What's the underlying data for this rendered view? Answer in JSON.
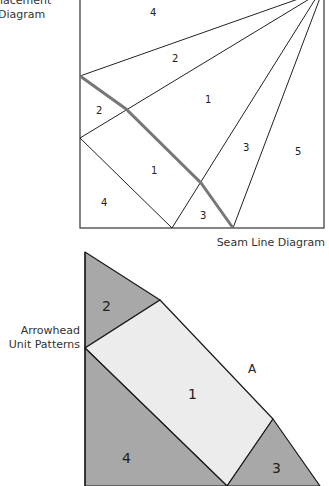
{
  "captions": {
    "placement": "Placement\nDiagram",
    "placement_line1": "lacement",
    "placement_line2": "Diagram",
    "seam": "Seam Line Diagram",
    "arrowhead_line1": "Arrowhead",
    "arrowhead_line2": "Unit Patterns"
  },
  "seam_diagram": {
    "labels": [
      {
        "text": "4",
        "x": 150,
        "y": 16
      },
      {
        "text": "2",
        "x": 172,
        "y": 62
      },
      {
        "text": "2",
        "x": 96,
        "y": 114
      },
      {
        "text": "1",
        "x": 205,
        "y": 103
      },
      {
        "text": "3",
        "x": 243,
        "y": 151
      },
      {
        "text": "5",
        "x": 295,
        "y": 155
      },
      {
        "text": "1",
        "x": 151,
        "y": 174
      },
      {
        "text": "4",
        "x": 101,
        "y": 206
      },
      {
        "text": "3",
        "x": 200,
        "y": 219
      }
    ]
  },
  "arrowhead_pattern": {
    "colors": {
      "dark": "#a8a8a8",
      "light": "#ececec",
      "stroke": "#1a1a1a"
    },
    "labels": [
      {
        "text": "2",
        "x": 107,
        "y": 309
      },
      {
        "text": "1",
        "x": 193,
        "y": 398
      },
      {
        "text": "A",
        "x": 252,
        "y": 373
      },
      {
        "text": "4",
        "x": 127,
        "y": 462
      },
      {
        "text": "3",
        "x": 277,
        "y": 472
      }
    ]
  }
}
